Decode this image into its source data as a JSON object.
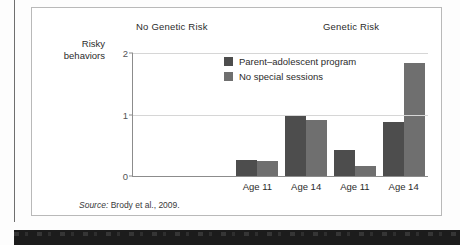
{
  "figure": {
    "source_prefix": "Source:",
    "source_text": " Brody et al., 2009."
  },
  "chart_data": {
    "type": "bar",
    "title": "",
    "xlabel": "",
    "ylabel": "Risky behaviors",
    "ylabel_line1": "Risky",
    "ylabel_line2": "behaviors",
    "ylim": [
      0,
      2
    ],
    "yticks": [
      "0",
      "1",
      "2"
    ],
    "ytick_values": [
      0,
      1,
      2
    ],
    "grid": true,
    "legend_position": "inside-top-center",
    "panels": [
      {
        "name": "No Genetic Risk",
        "categories": [
          "Age 11",
          "Age 14"
        ]
      },
      {
        "name": "Genetic Risk",
        "categories": [
          "Age 11",
          "Age 14"
        ]
      }
    ],
    "categories": [
      "Age 11",
      "Age 14",
      "Age 11",
      "Age 14"
    ],
    "series": [
      {
        "name": "Parent–adolescent program",
        "color": "#4d4d4d",
        "values": [
          0.26,
          1.0,
          0.43,
          0.88
        ]
      },
      {
        "name": "No special sessions",
        "color": "#6f6f6f",
        "values": [
          0.24,
          0.91,
          0.16,
          1.83
        ]
      }
    ]
  }
}
